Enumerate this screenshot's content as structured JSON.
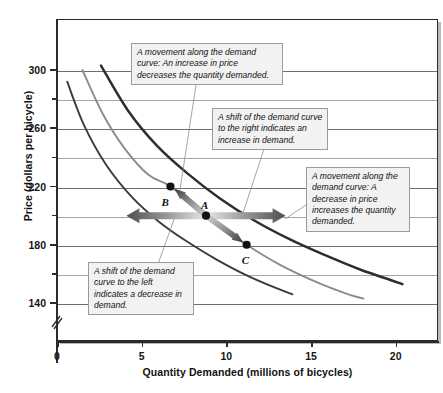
{
  "chart_data": {
    "type": "line",
    "title": "",
    "xlabel": "Quantity Demanded (millions of bicycles)",
    "ylabel": "Price (dollars per bicycle)",
    "xlim": [
      0,
      22.5
    ],
    "ylim": [
      120,
      312
    ],
    "xticks": [
      "0",
      "5",
      "10",
      "15",
      "20"
    ],
    "xtick_values": [
      0,
      5,
      10,
      15,
      20
    ],
    "yticks": [
      "140",
      "180",
      "220",
      "260",
      "300"
    ],
    "ytick_values": [
      140,
      180,
      220,
      260,
      300
    ],
    "yticks_minor": [
      160,
      200,
      240,
      280
    ],
    "grid": "horizontal",
    "axis_break": true,
    "legend": "none",
    "series": [
      {
        "name": "D3 (demand curve shifted left)",
        "color": "#3b3b3b",
        "points": [
          [
            0.6,
            292
          ],
          [
            1.6,
            262
          ],
          [
            2.9,
            235
          ],
          [
            4.4,
            213
          ],
          [
            6.0,
            196
          ],
          [
            7.7,
            182
          ],
          [
            9.4,
            170
          ],
          [
            11.2,
            159
          ],
          [
            13.0,
            150
          ],
          [
            13.9,
            146
          ]
        ]
      },
      {
        "name": "D1 (original demand curve through A, B, C)",
        "color": "#8c8c8c",
        "points": [
          [
            1.5,
            300
          ],
          [
            2.7,
            270
          ],
          [
            4.0,
            246
          ],
          [
            5.4,
            228
          ],
          [
            6.7,
            220
          ],
          [
            8.8,
            200
          ],
          [
            11.2,
            180
          ],
          [
            13.2,
            166
          ],
          [
            15.4,
            154
          ],
          [
            17.2,
            146
          ],
          [
            18.1,
            143
          ]
        ]
      },
      {
        "name": "D2 (demand curve shifted right)",
        "color": "#2e2e2e",
        "points": [
          [
            2.6,
            303
          ],
          [
            4.2,
            272
          ],
          [
            5.9,
            248
          ],
          [
            7.7,
            229
          ],
          [
            9.6,
            212
          ],
          [
            11.6,
            197
          ],
          [
            13.7,
            184
          ],
          [
            15.8,
            173
          ],
          [
            17.9,
            163
          ],
          [
            19.9,
            155
          ],
          [
            20.4,
            153
          ]
        ]
      }
    ],
    "annotated_points": [
      {
        "label": "B",
        "x": 6.7,
        "y": 220
      },
      {
        "label": "A",
        "x": 8.8,
        "y": 200
      },
      {
        "label": "C",
        "x": 11.2,
        "y": 180
      }
    ],
    "arrows": [
      {
        "name": "movement-up-arrow",
        "from": [
          8.8,
          200
        ],
        "to": [
          6.7,
          220
        ],
        "style": "gradient-tapered",
        "meaning": "increase in price decreases quantity demanded"
      },
      {
        "name": "movement-down-arrow",
        "from": [
          8.8,
          200
        ],
        "to": [
          11.2,
          180
        ],
        "style": "gradient-tapered",
        "meaning": "decrease in price increases quantity demanded"
      },
      {
        "name": "shift-left-arrow",
        "from": [
          8.8,
          200
        ],
        "to": [
          4.1,
          200
        ],
        "style": "gradient-block",
        "meaning": "shift of demand curve to the left"
      },
      {
        "name": "shift-right-arrow",
        "from": [
          8.8,
          200
        ],
        "to": [
          13.5,
          200
        ],
        "style": "gradient-block",
        "meaning": "shift of demand curve to the right"
      }
    ]
  },
  "annotations": {
    "move_up": "A movement along the demand curve: An increase  in price decreases the quantity demanded.",
    "shift_right": "A shift of the demand curve to the right indicates an increase in demand.",
    "move_down": "A movement along the demand curve: A decrease in price increases the quantity demanded.",
    "shift_left": "A shift of the demand curve to the left indicates a decrease in demand."
  },
  "point_labels": {
    "a": "A",
    "b": "B",
    "c": "C"
  },
  "colors": {
    "curve_dark": "#2e2e2e",
    "curve_gray": "#8c8c8c",
    "gridline": "#6e6e6e",
    "axis": "#2b2b2b",
    "callout_bg": "#f2f2f2",
    "callout_border": "#9a9a9a",
    "arrow": "#5a5a5a"
  }
}
